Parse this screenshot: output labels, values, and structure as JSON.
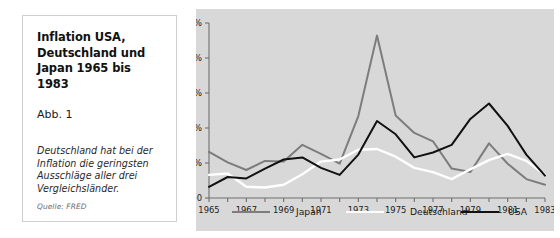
{
  "caption": {
    "title": "Inflation USA, Deutschland und Japan 1965 bis 1983",
    "figure_label": "Abb. 1",
    "note": "Deutschland hat bei der Inflation die geringsten Ausschläge aller drei Vergleichsländer.",
    "source": "Quelle: FRED"
  },
  "colors": {
    "plot_background": "#d8d8d8",
    "panel_background": "#ffffff",
    "axis": "#6f6f6f",
    "japan": "#7d7d7d",
    "deutschland": "#ffffff",
    "usa": "#111111"
  },
  "chart_data": {
    "type": "line",
    "title": "Inflation USA, Deutschland und Japan 1965 bis 1983",
    "xlabel": "",
    "ylabel": "",
    "xlim": [
      1965,
      1983
    ],
    "ylim": [
      0,
      25
    ],
    "grid": false,
    "legend_position": "bottom",
    "x": [
      1965,
      1966,
      1967,
      1968,
      1969,
      1970,
      1971,
      1972,
      1973,
      1974,
      1975,
      1976,
      1977,
      1978,
      1979,
      1980,
      1981,
      1982,
      1983
    ],
    "xticklabels": [
      "1965",
      "1967",
      "1969",
      "1971",
      "1973",
      "1975",
      "1977",
      "1979",
      "1981",
      "1983"
    ],
    "xtickvalues": [
      1965,
      1967,
      1969,
      1971,
      1973,
      1975,
      1977,
      1979,
      1981,
      1983
    ],
    "yticklabels": [
      "0",
      "5%",
      "10%",
      "15%",
      "20%",
      "25%"
    ],
    "ytickvalues": [
      0,
      5,
      10,
      15,
      20,
      25
    ],
    "series": [
      {
        "name": "Japan",
        "color": "#7d7d7d",
        "values": [
          6.6,
          5.1,
          4.0,
          5.3,
          5.2,
          7.6,
          6.3,
          4.9,
          11.7,
          23.2,
          11.8,
          9.3,
          8.1,
          4.2,
          3.7,
          7.8,
          4.9,
          2.7,
          1.9
        ]
      },
      {
        "name": "Deutschland",
        "color": "#ffffff",
        "values": [
          3.3,
          3.5,
          1.6,
          1.5,
          1.9,
          3.4,
          5.2,
          5.5,
          6.9,
          7.0,
          5.9,
          4.3,
          3.7,
          2.7,
          4.1,
          5.4,
          6.3,
          5.3,
          3.3
        ]
      },
      {
        "name": "USA",
        "color": "#111111",
        "values": [
          1.6,
          3.0,
          2.8,
          4.2,
          5.5,
          5.8,
          4.3,
          3.3,
          6.2,
          11.0,
          9.1,
          5.8,
          6.5,
          7.6,
          11.3,
          13.5,
          10.3,
          6.2,
          3.2
        ]
      }
    ]
  }
}
